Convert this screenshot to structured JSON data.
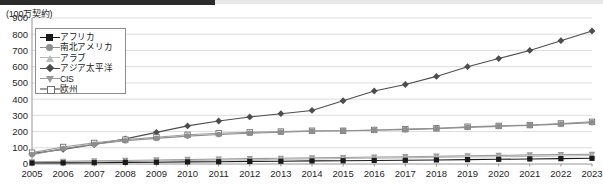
{
  "axis": {
    "unit_label": "(100万契約)",
    "x_unit": "(年)",
    "y_ticks": [
      "900",
      "800",
      "700",
      "600",
      "500",
      "400",
      "300",
      "200",
      "100",
      "0"
    ],
    "x_ticks": [
      "2005",
      "2006",
      "2007",
      "2008",
      "2009",
      "2010",
      "2011",
      "2012",
      "2013",
      "2014",
      "2015",
      "2016",
      "2017",
      "2018",
      "2019",
      "2020",
      "2021",
      "2022",
      "2023"
    ]
  },
  "legend": {
    "items": [
      {
        "label": "アフリカ",
        "marker": "filled-square",
        "color": "#1a1a1a"
      },
      {
        "label": "南北アメリカ",
        "marker": "filled-circle",
        "color": "#8e8e8e"
      },
      {
        "label": "アラブ",
        "marker": "filled-triangle",
        "color": "#b9b9b9"
      },
      {
        "label": "アジア太平洋",
        "marker": "filled-diamond",
        "color": "#4d4d4d"
      },
      {
        "label": "CIS",
        "marker": "inverted-triangle",
        "color": "#9a9a9a"
      },
      {
        "label": "欧州",
        "marker": "open-square",
        "color": "#9c9c9c"
      }
    ]
  },
  "chart_data": {
    "type": "line",
    "title": "",
    "xlabel": "(年)",
    "ylabel": "(100万契約)",
    "ylim": [
      0,
      900
    ],
    "ytick_step": 100,
    "grid": true,
    "legend_position": "top-left-inside",
    "categories": [
      "2005",
      "2006",
      "2007",
      "2008",
      "2009",
      "2010",
      "2011",
      "2012",
      "2013",
      "2014",
      "2015",
      "2016",
      "2017",
      "2018",
      "2019",
      "2020",
      "2021",
      "2022",
      "2023"
    ],
    "series": [
      {
        "name": "アジア太平洋",
        "marker": "filled-diamond",
        "color": "#4d4d4d",
        "values": [
          65,
          90,
          120,
          155,
          195,
          235,
          265,
          290,
          310,
          330,
          390,
          450,
          490,
          540,
          600,
          650,
          700,
          760,
          820
        ]
      },
      {
        "name": "欧州",
        "marker": "open-square",
        "color": "#9c9c9c",
        "values": [
          70,
          105,
          130,
          150,
          165,
          180,
          190,
          195,
          200,
          205,
          205,
          210,
          215,
          220,
          230,
          235,
          240,
          250,
          260
        ]
      },
      {
        "name": "南北アメリカ",
        "marker": "filled-circle",
        "color": "#8e8e8e",
        "values": [
          58,
          95,
          122,
          143,
          158,
          172,
          182,
          190,
          196,
          202,
          205,
          208,
          212,
          218,
          226,
          232,
          238,
          246,
          255
        ]
      },
      {
        "name": "CIS",
        "marker": "inverted-triangle",
        "color": "#9a9a9a",
        "values": [
          14,
          16,
          19,
          22,
          25,
          28,
          30,
          33,
          35,
          38,
          40,
          43,
          45,
          48,
          50,
          53,
          56,
          58,
          60
        ]
      },
      {
        "name": "アラブ",
        "marker": "filled-triangle",
        "color": "#b9b9b9",
        "values": [
          10,
          12,
          14,
          17,
          19,
          22,
          24,
          26,
          29,
          31,
          34,
          36,
          38,
          41,
          43,
          45,
          47,
          49,
          52
        ]
      },
      {
        "name": "アフリカ",
        "marker": "filled-square",
        "color": "#1a1a1a",
        "values": [
          6,
          7,
          8,
          10,
          11,
          13,
          14,
          16,
          17,
          19,
          20,
          22,
          23,
          25,
          27,
          29,
          31,
          33,
          35
        ]
      }
    ]
  }
}
